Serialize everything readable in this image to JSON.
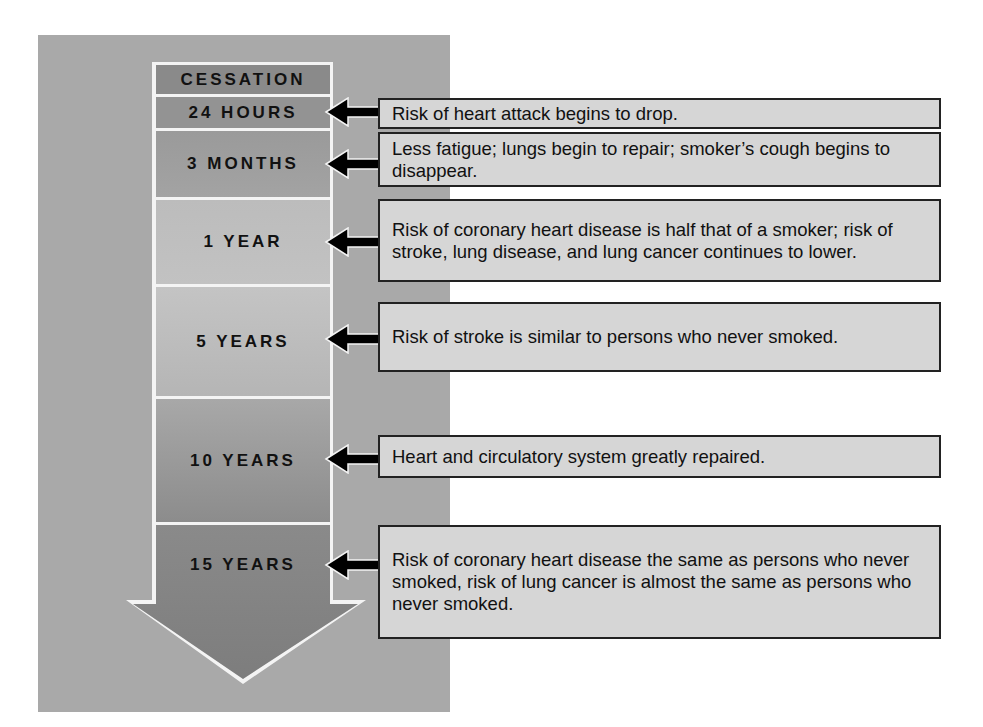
{
  "timeline": {
    "header": "CESSATION",
    "stages": [
      {
        "label": "24 HOURS",
        "description": "Risk of heart attack begins to drop."
      },
      {
        "label": "3 MONTHS",
        "description": "Less fatigue; lungs begin to repair; smoker’s cough begins to disappear."
      },
      {
        "label": "1 YEAR",
        "description": "Risk of coronary heart disease is half that of a smoker; risk of stroke, lung disease, and lung cancer continues to lower."
      },
      {
        "label": "5 YEARS",
        "description": "Risk of stroke is similar to persons who never smoked."
      },
      {
        "label": "10 YEARS",
        "description": "Heart and circulatory system greatly repaired."
      },
      {
        "label": "15 YEARS",
        "description": "Risk of coronary heart disease the same as persons who never smoked, risk of lung cancer is almost the same as persons who never smoked."
      }
    ]
  },
  "colors": {
    "panel": "#a9a9a9",
    "header_fill": "#8a8a8a",
    "box_fill": "#d6d6d6",
    "arrow": "#000000"
  }
}
